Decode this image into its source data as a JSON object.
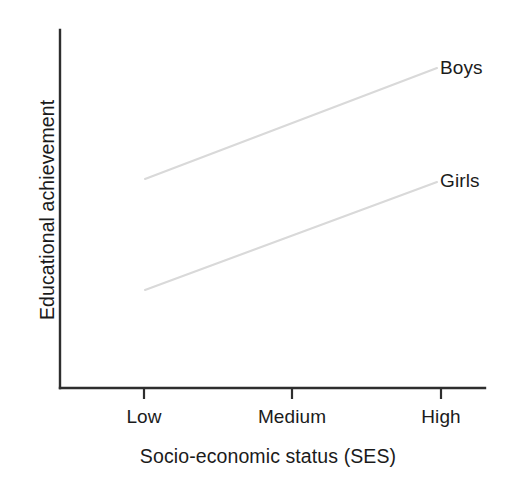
{
  "chart_data": {
    "type": "line",
    "title": "",
    "xlabel": "Socio-economic status (SES)",
    "ylabel": "Educational achievement",
    "categories": [
      "Low",
      "Medium",
      "High"
    ],
    "grid": false,
    "legend_position": "at-line-end",
    "axis_style": "open-left-bottom-spines-only",
    "xlim": [
      0,
      2
    ],
    "ylim": [
      0,
      1
    ],
    "series": [
      {
        "name": "Boys",
        "label": "Boys",
        "color": "#d9d9d9",
        "values": [
          0.58,
          0.74,
          0.89
        ],
        "x_pixels": [
          145,
          291,
          437
        ],
        "y_pixels": [
          179,
          123.5,
          68
        ]
      },
      {
        "name": "Girls",
        "label": "Girls",
        "color": "#d9d9d9",
        "values": [
          0.27,
          0.42,
          0.57
        ],
        "x_pixels": [
          145,
          291,
          437
        ],
        "y_pixels": [
          290,
          236,
          182
        ]
      }
    ],
    "annotations": [
      {
        "text": "Boys",
        "x": 441,
        "y": 68
      },
      {
        "text": "Girls",
        "x": 441,
        "y": 182
      }
    ],
    "axes_geometry": {
      "x_axis_y": 388,
      "x_axis_x0": 60,
      "x_axis_x1": 485,
      "y_axis_x": 60,
      "y_axis_y0": 30,
      "y_axis_y1": 388,
      "tick_x_positions": [
        144,
        292,
        441
      ],
      "tick_length": 11
    },
    "colors": {
      "axis": "#2e2e2e",
      "text": "#1b1b1b",
      "line": "#d9d9d9",
      "background": "#ffffff"
    }
  }
}
